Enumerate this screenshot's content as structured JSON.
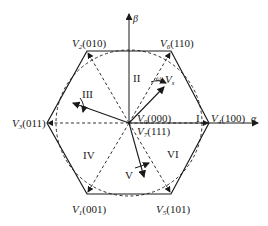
{
  "diagram": {
    "axes": {
      "alpha": "α",
      "beta": "β"
    },
    "vectors": [
      {
        "id": "V4",
        "name": "V",
        "sub": "4",
        "code": "(100)"
      },
      {
        "id": "V6",
        "name": "V",
        "sub": "6",
        "code": "(110)"
      },
      {
        "id": "V2",
        "name": "V",
        "sub": "2",
        "code": "(010)"
      },
      {
        "id": "V3",
        "name": "V",
        "sub": "3",
        "code": "(011)"
      },
      {
        "id": "V1",
        "name": "V",
        "sub": "1",
        "code": "(001)"
      },
      {
        "id": "V5",
        "name": "V",
        "sub": "5",
        "code": "(101)"
      },
      {
        "id": "V0",
        "name": "V",
        "sub": "0",
        "code": "(000)"
      },
      {
        "id": "V7",
        "name": "V",
        "sub": "7",
        "code": "(111)"
      }
    ],
    "sectors": [
      "I",
      "II",
      "III",
      "IV",
      "V",
      "VI"
    ],
    "reference_vector": {
      "name": "V",
      "sub": "s"
    },
    "angular_speed": "ω",
    "colors": {
      "line": "#1a1a1a",
      "background": "#ffffff"
    }
  }
}
